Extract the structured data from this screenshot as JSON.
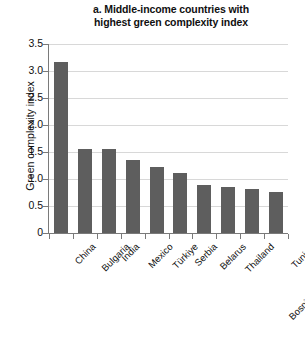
{
  "chart_data": {
    "type": "bar",
    "title": "a. Middle-income countries with highest green complexity index",
    "title_lines": [
      "a. Middle-income countries with",
      "highest green complexity index"
    ],
    "xlabel": "",
    "ylabel": "Green complexity index",
    "ylim": [
      0,
      3.5
    ],
    "ytick_labels": [
      "0",
      "0.5",
      "1.0",
      "1.5",
      "2.0",
      "2.5",
      "3.0",
      "3.5"
    ],
    "ytick_values": [
      0,
      0.5,
      1.0,
      1.5,
      2.0,
      2.5,
      3.0,
      3.5
    ],
    "grid": true,
    "legend": "none",
    "bar_color": "#5e5e5e",
    "gridline_color": "#d8d8d8",
    "axis_color": "#7a7a7a",
    "categories": [
      "China",
      "Bulgaria",
      "India",
      "Mexico",
      "Türkiye",
      "Serbia",
      "Belarus",
      "Thailand",
      "Bosnia and Herzegovina",
      "Tunisia"
    ],
    "values": [
      3.16,
      1.56,
      1.56,
      1.36,
      1.22,
      1.12,
      0.88,
      0.85,
      0.81,
      0.76
    ]
  }
}
